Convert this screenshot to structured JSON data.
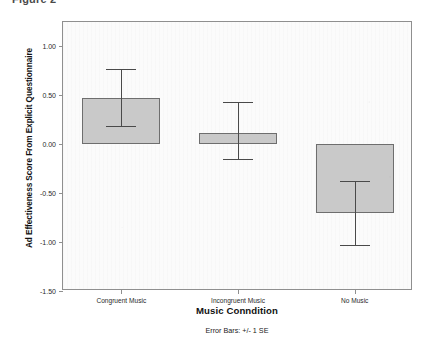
{
  "figure": {
    "caption_fragment": "Figure 2",
    "error_bar_note": "Error Bars: +/- 1 SE"
  },
  "chart_data": {
    "type": "bar",
    "title": "",
    "xlabel": "Music Conndition",
    "ylabel": "Ad Effectiveness Score From Explicit Questionnaire",
    "categories": [
      "Congruent Music",
      "Incongruent Music",
      "No Music"
    ],
    "values": [
      0.47,
      0.12,
      -0.7
    ],
    "error_upper": [
      0.77,
      0.43,
      -0.38
    ],
    "error_lower": [
      0.19,
      -0.15,
      -1.03
    ],
    "error_type": "+/- 1 SE",
    "ylim": [
      -1.5,
      1.25
    ],
    "yticks": [
      1.0,
      0.5,
      0.0,
      -0.5,
      -1.0,
      -1.5
    ],
    "ytick_labels": [
      "1.00",
      "0.50",
      "0.00",
      "-0.50",
      "-1.00",
      "-1.50"
    ],
    "baseline": 0.0,
    "grid": false,
    "legend": null,
    "bar_fill_color": "#c9c9c9",
    "bar_edge_color": "#6e6e6e",
    "error_bar_color": "#4a4a4a",
    "plot_background": "#fbfbfb",
    "axis_color": "#8f8f8f"
  }
}
